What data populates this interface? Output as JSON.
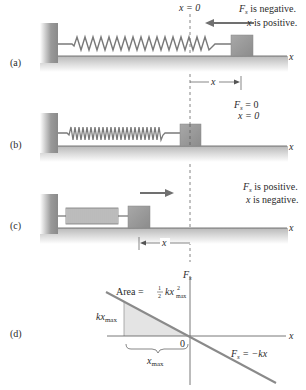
{
  "panels": [
    {
      "id": "a",
      "label": "(a)",
      "text_line1": "is negative.",
      "text_line2": "is positive.",
      "force_symbol": "F",
      "force_sub": "s",
      "x_symbol": "x",
      "zero_label": "x = 0",
      "axis_label": "x",
      "displacement_label": "x",
      "arrow_direction": "left"
    },
    {
      "id": "b",
      "label": "(b)",
      "text_line1": "= 0",
      "text_line2": "x = 0",
      "force_symbol": "F",
      "force_sub": "s",
      "axis_label": "x"
    },
    {
      "id": "c",
      "label": "(c)",
      "text_line1": "is positive.",
      "text_line2": "is negative.",
      "force_symbol": "F",
      "force_sub": "s",
      "x_symbol": "x",
      "axis_label": "x",
      "displacement_label": "x",
      "arrow_direction": "right"
    },
    {
      "id": "d",
      "label": "(d)",
      "y_axis_label": "F",
      "y_axis_sub": "s",
      "x_axis_label": "x",
      "origin_label": "0",
      "area_label": "Area = ",
      "area_frac_num": "1",
      "area_frac_den": "2",
      "area_expr": "kx",
      "area_sup": "2",
      "area_sub": "max",
      "height_label": "kx",
      "height_sub": "max",
      "width_label": "x",
      "width_sub": "max",
      "line_label_F": "F",
      "line_label_sub": "s",
      "line_label_eq": " = −kx"
    }
  ],
  "colors": {
    "wall": "#8a8a8a",
    "floor_shadow": "#c8c8c8",
    "spring": "#7a7a7a",
    "block": "#9a9a9a",
    "arrow": "#707070",
    "dashed": "#666666",
    "shaded_area": "#e4e4e4",
    "graph_line": "#8a8a8a"
  }
}
